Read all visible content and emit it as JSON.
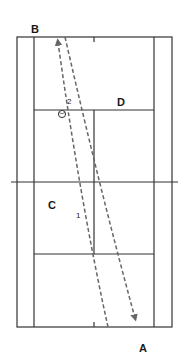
{
  "diagram": {
    "type": "tennis-court-top-view",
    "colors": {
      "lines": "#333333",
      "paths": "#666666",
      "background": "#ffffff"
    },
    "labels": {
      "B": "B",
      "D": "D",
      "C": "C",
      "A": "A"
    },
    "shot_numbers": {
      "first": "1",
      "second": "2"
    },
    "ball_icon": "tennis-ball-icon",
    "paths": [
      {
        "name": "shot-path-to-b",
        "from": "bottom-center",
        "to": "B-side baseline",
        "style": "dashed-arrow"
      },
      {
        "name": "shot-path-to-a",
        "from": "top baseline",
        "to": "A-side baseline",
        "style": "dashed-arrow"
      }
    ]
  }
}
